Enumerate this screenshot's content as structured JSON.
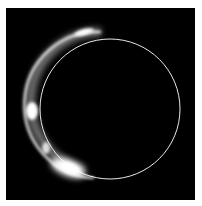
{
  "image": {
    "subject": "solar eclipse with Baily's beads",
    "background_color": "#000000",
    "border_color": "#ffffff",
    "ring_color": "#ffffff"
  }
}
